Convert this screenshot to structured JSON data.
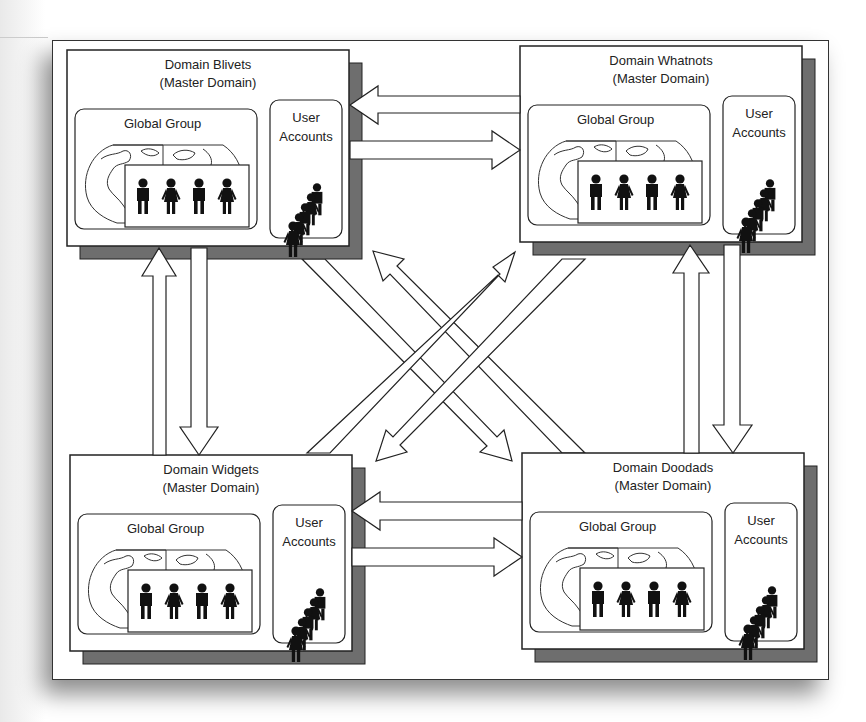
{
  "diagram": {
    "colors": {
      "shadow": "#6e6e6e",
      "line": "#222222",
      "fill": "#ffffff",
      "people": "#111111"
    },
    "domains": [
      {
        "id": "blivets",
        "name": "Domain Blivets",
        "role": "(Master Domain)",
        "group_label": "Global Group",
        "accounts_label_1": "User",
        "accounts_label_2": "Accounts",
        "position": "top-left"
      },
      {
        "id": "whatnots",
        "name": "Domain Whatnots",
        "role": "(Master Domain)",
        "group_label": "Global Group",
        "accounts_label_1": "User",
        "accounts_label_2": "Accounts",
        "position": "top-right"
      },
      {
        "id": "widgets",
        "name": "Domain Widgets",
        "role": "(Master Domain)",
        "group_label": "Global Group",
        "accounts_label_1": "User",
        "accounts_label_2": "Accounts",
        "position": "bottom-left"
      },
      {
        "id": "doodads",
        "name": "Domain Doodads",
        "role": "(Master Domain)",
        "group_label": "Global Group",
        "accounts_label_1": "User",
        "accounts_label_2": "Accounts",
        "position": "bottom-right"
      }
    ],
    "trust_arrows": [
      {
        "from": "whatnots",
        "to": "blivets"
      },
      {
        "from": "blivets",
        "to": "whatnots"
      },
      {
        "from": "doodads",
        "to": "widgets"
      },
      {
        "from": "widgets",
        "to": "doodads"
      },
      {
        "from": "widgets",
        "to": "blivets"
      },
      {
        "from": "blivets",
        "to": "widgets"
      },
      {
        "from": "doodads",
        "to": "whatnots"
      },
      {
        "from": "whatnots",
        "to": "doodads"
      },
      {
        "from": "blivets",
        "to": "doodads"
      },
      {
        "from": "doodads",
        "to": "blivets"
      },
      {
        "from": "widgets",
        "to": "whatnots"
      },
      {
        "from": "whatnots",
        "to": "widgets"
      }
    ],
    "icons": {
      "globe": "globe-icon",
      "group_people": "people-group-icon",
      "accounts_people": "user-accounts-stack-icon"
    }
  }
}
